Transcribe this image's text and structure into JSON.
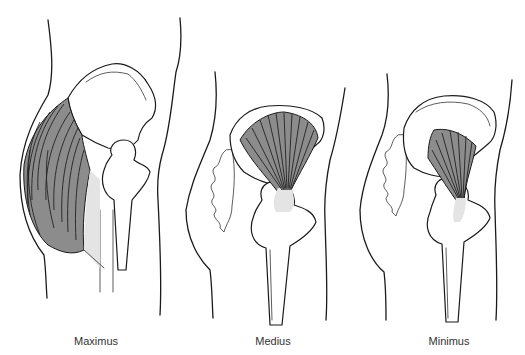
{
  "figure": {
    "colors": {
      "muscle_fill": "#8c8c8c",
      "tendon_fill": "#e4e4e4",
      "line": "#1a1a1a",
      "label_text": "#333333",
      "background": "#ffffff"
    },
    "panels": [
      {
        "id": "maximus",
        "label": "Maximus"
      },
      {
        "id": "medius",
        "label": "Medius"
      },
      {
        "id": "minimus",
        "label": "Minimus"
      }
    ]
  }
}
